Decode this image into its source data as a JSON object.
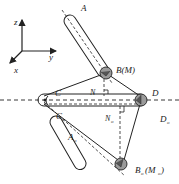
{
  "diagram": {
    "type": "mechanism-geometry",
    "axes": {
      "z": "z",
      "y": "y",
      "x": "x"
    },
    "labels": {
      "A": "A",
      "B": "B(M)",
      "C": "C",
      "D": "D",
      "N": "N",
      "Co": "C",
      "Co_sub": "o",
      "No": "N",
      "No_sub": "o",
      "Do": "D",
      "Do_sub": "o",
      "Ao": "A",
      "Ao_sub": "o",
      "Bo": "B",
      "Bo_sub": "o",
      "Bo_paren": "(M",
      "Bo_paren_sub": "o",
      "Bo_close": ")"
    },
    "colors": {
      "line": "#222222",
      "joint": "#9a9a9a",
      "background": "#ffffff"
    }
  }
}
